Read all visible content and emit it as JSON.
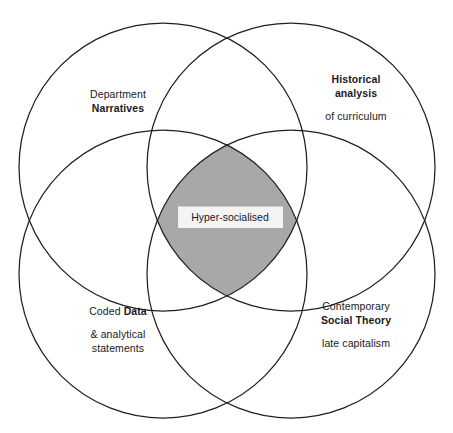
{
  "diagram": {
    "type": "four-circle-venn",
    "background_color": "#ffffff",
    "stroke_color": "#231f20",
    "core_fill_color": "#a8a8a8",
    "label_band_color": "#f4f4f4",
    "core": {
      "label": "Hyper-socialised"
    },
    "regions": [
      {
        "position": "top-left",
        "line1": "Department",
        "line2": "Narratives"
      },
      {
        "position": "top-right",
        "line1": "Historical",
        "line2": "analysis",
        "line3": "of curriculum"
      },
      {
        "position": "bottom-left",
        "line1": "Coded ",
        "line2": "Data",
        "line3": "& analytical",
        "line4": "statements"
      },
      {
        "position": "bottom-right",
        "line1": "Contemporary",
        "line2": "Social Theory",
        "line3": "late capitalism"
      }
    ]
  }
}
